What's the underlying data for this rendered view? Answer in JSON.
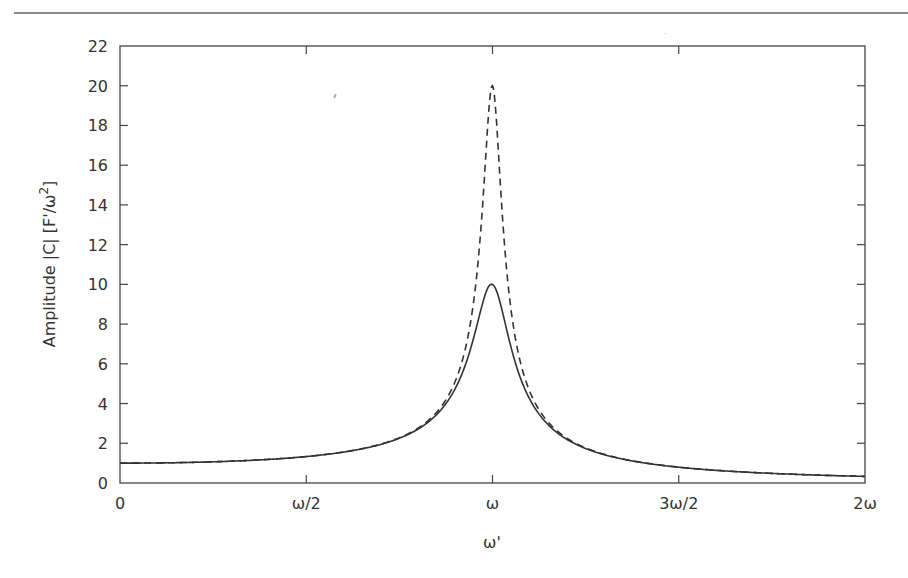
{
  "chart_data": {
    "type": "line",
    "title": "",
    "xlabel": "ω'",
    "ylabel": "Amplitude |C| [F'/ω²]",
    "ylabel_parts": {
      "main": "Amplitude |C| [F'/ω",
      "sup": "2",
      "end": "]"
    },
    "xlim": [
      0,
      2
    ],
    "ylim": [
      0,
      22
    ],
    "x_ticks": [
      {
        "value": 0,
        "label": "0"
      },
      {
        "value": 0.5,
        "label": "ω/2"
      },
      {
        "value": 1,
        "label": "ω"
      },
      {
        "value": 1.5,
        "label": "3ω/2"
      },
      {
        "value": 2,
        "label": "2ω"
      }
    ],
    "y_ticks": [
      0,
      2,
      4,
      6,
      8,
      10,
      12,
      14,
      16,
      18,
      20,
      22
    ],
    "grid": false,
    "legend": null,
    "series": [
      {
        "name": "Q = 10 (solid)",
        "style": "solid",
        "color": "#333333",
        "quality_factor": 10,
        "x": [
          0,
          0.25,
          0.5,
          0.75,
          0.9,
          0.95,
          1.0,
          1.05,
          1.1,
          1.25,
          1.5,
          1.75,
          2.0
        ],
        "values": [
          1.0,
          1.07,
          1.33,
          2.27,
          4.6,
          6.9,
          10.0,
          7.0,
          4.4,
          1.74,
          0.79,
          0.48,
          0.33
        ]
      },
      {
        "name": "Q = 20 (dashed)",
        "style": "dashed",
        "color": "#333333",
        "quality_factor": 20,
        "x": [
          0,
          0.25,
          0.5,
          0.75,
          0.9,
          0.95,
          1.0,
          1.05,
          1.1,
          1.25,
          1.5,
          1.75,
          2.0
        ],
        "values": [
          1.0,
          1.07,
          1.33,
          2.28,
          5.0,
          9.0,
          20.0,
          9.3,
          4.7,
          1.77,
          0.8,
          0.48,
          0.33
        ]
      }
    ]
  }
}
